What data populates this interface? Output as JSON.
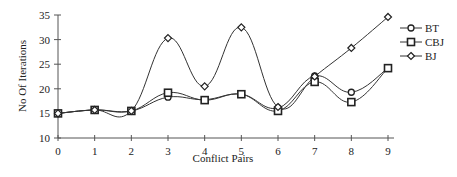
{
  "chart_data": {
    "type": "line",
    "title": "",
    "xlabel": "Conflict Pairs",
    "ylabel": "No Of Iterations",
    "x": [
      0,
      1,
      2,
      3,
      4,
      5,
      6,
      7,
      8,
      9
    ],
    "ylim": [
      10,
      35
    ],
    "yticks": [
      10,
      15,
      20,
      25,
      30,
      35
    ],
    "grid": false,
    "legend_position": "right",
    "series": [
      {
        "name": "BT",
        "marker": "circle",
        "values": [
          15,
          15.7,
          15.5,
          18.3,
          17.8,
          18.9,
          16.1,
          22.6,
          19.3,
          24.2
        ]
      },
      {
        "name": "CBJ",
        "marker": "square",
        "values": [
          15,
          15.7,
          15.5,
          19.2,
          17.7,
          18.9,
          15.5,
          21.4,
          17.3,
          24.2
        ]
      },
      {
        "name": "BJ",
        "marker": "diamond",
        "values": [
          15,
          15.7,
          15.5,
          30.3,
          20.5,
          32.5,
          16.3,
          22.5,
          28.3,
          34.6
        ]
      }
    ]
  }
}
